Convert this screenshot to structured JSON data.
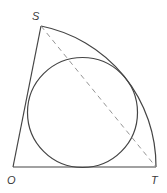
{
  "diagram": {
    "type": "geometry",
    "points": {
      "O": {
        "label": "O",
        "x": 13,
        "y": 167
      },
      "S": {
        "label": "S",
        "x": 41,
        "y": 26
      },
      "T": {
        "label": "T",
        "x": 156,
        "y": 167
      }
    },
    "arc": {
      "from": "S",
      "to": "T",
      "center": "O",
      "radius": 143
    },
    "inscribed_circle": {
      "cx": 82.5,
      "cy": 112.5,
      "r": 55
    },
    "chord": {
      "from": "S",
      "to": "T",
      "style": "dashed"
    },
    "colors": {
      "stroke": "#444444",
      "dashed": "#888888",
      "label": "#3a3a3a"
    }
  }
}
